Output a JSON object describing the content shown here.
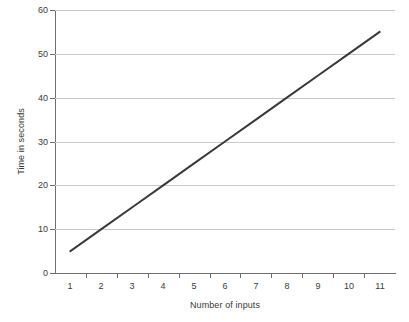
{
  "chart_data": {
    "type": "line",
    "title": "",
    "subtitle": "",
    "xlabel": "Number of inputs",
    "ylabel": "Time in seconds",
    "categories": [
      1,
      2,
      3,
      4,
      5,
      6,
      7,
      8,
      9,
      10,
      11
    ],
    "x_tick_labels": [
      "1",
      "2",
      "3",
      "4",
      "5",
      "6",
      "7",
      "8",
      "9",
      "10",
      "11"
    ],
    "y_tick_labels": [
      "0",
      "10",
      "20",
      "30",
      "40",
      "50",
      "60"
    ],
    "y_ticks": [
      0,
      10,
      20,
      30,
      40,
      50,
      60
    ],
    "ylim": [
      0,
      60
    ],
    "xlim": [
      1,
      11
    ],
    "grid": "horizontal",
    "legend": "none",
    "series": [
      {
        "name": "Time in seconds",
        "color": "#3a3a3a",
        "line_width": 2,
        "markers": "none",
        "x": [
          1,
          2,
          3,
          4,
          5,
          6,
          7,
          8,
          9,
          10,
          11
        ],
        "values": [
          5,
          10,
          15,
          20,
          25,
          30,
          35,
          40,
          45,
          50,
          55
        ]
      }
    ],
    "annotations": [],
    "colors": {
      "background": "#ffffff",
      "gridline": "#c9c9c9",
      "axis": "#6e6e6e",
      "text": "#3a3a3a",
      "series": "#3a3a3a"
    }
  }
}
